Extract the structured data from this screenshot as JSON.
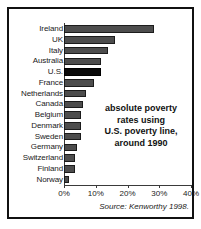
{
  "chart_data": {
    "type": "bar",
    "orientation": "horizontal",
    "title": "",
    "xlabel": "",
    "ylabel": "",
    "xlim": [
      0,
      40
    ],
    "grid": false,
    "legend": null,
    "tick_labels": [
      "0%",
      "10%",
      "20%",
      "30%",
      "40%"
    ],
    "tick_values": [
      0,
      10,
      20,
      30,
      40
    ],
    "categories": [
      "Ireland",
      "UK",
      "Italy",
      "Australia",
      "U.S.",
      "France",
      "Netherlands",
      "Canada",
      "Belgium",
      "Denmark",
      "Sweden",
      "Germany",
      "Switzerland",
      "Finland",
      "Norway"
    ],
    "values": [
      28.5,
      16,
      14,
      11.5,
      11.5,
      9.5,
      7,
      6,
      5.5,
      5.5,
      5.5,
      4,
      3.5,
      3.5,
      1.5
    ],
    "highlighted_category": "U.S.",
    "bar_color": "#4d4d4d",
    "highlight_color": "#0a0a0a",
    "annotation": {
      "lines": [
        "absolute poverty",
        "rates using",
        "U.S. poverty line,",
        "around 1990"
      ]
    },
    "source": "Source: Kenworthy 1998."
  }
}
